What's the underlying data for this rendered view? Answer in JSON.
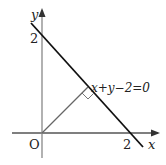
{
  "diagram": {
    "axis_x_label": "x",
    "axis_y_label": "y",
    "origin_label": "O",
    "x_intercept_label": "2",
    "y_intercept_label": "2",
    "line_equation": "x+y−2=0",
    "colors": {
      "axis": "#888888",
      "line": "#111111",
      "perpendicular": "#666666"
    }
  }
}
